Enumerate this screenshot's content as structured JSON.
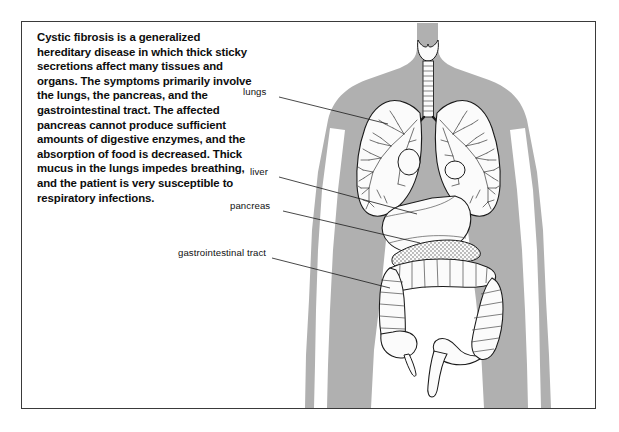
{
  "figure": {
    "description": "Cystic fibrosis is a generalized hereditary disease in which thick sticky secretions affect many tissues and organs. The symptoms primarily involve the lungs, the pancreas, and the gastrointestinal tract. The affected pancreas cannot produce sufficient amounts of digestive enzymes, and the absorption of food is decreased. Thick mucus in the lungs impedes breathing, and the patient is very susceptible to respiratory infections.",
    "colors": {
      "body_silhouette": "#b0b0b0",
      "organ_fill": "#fbfbfb",
      "outline": "#1a1a1a",
      "frame_border": "#3a3a3a",
      "background": "#ffffff",
      "text": "#0d0d0d"
    },
    "callouts": [
      {
        "id": "lungs",
        "label": "lungs",
        "label_x": 243,
        "label_y": 92,
        "line_x1": 279,
        "line_y1": 97,
        "line_x2": 388,
        "line_y2": 124
      },
      {
        "id": "liver",
        "label": "liver",
        "label_x": 250,
        "label_y": 172,
        "line_x1": 279,
        "line_y1": 177,
        "line_x2": 417,
        "line_y2": 214
      },
      {
        "id": "pancreas",
        "label": "pancreas",
        "label_x": 230,
        "label_y": 206,
        "line_x1": 283,
        "line_y1": 211,
        "line_x2": 420,
        "line_y2": 243
      },
      {
        "id": "gastrointestinal-tract",
        "label": "gastrointestinal tract",
        "label_x": 178,
        "label_y": 253,
        "line_x1": 272,
        "line_y1": 258,
        "line_x2": 390,
        "line_y2": 288
      }
    ],
    "organs": [
      "larynx",
      "trachea",
      "left lung",
      "right lung",
      "liver",
      "pancreas",
      "transverse colon",
      "ascending colon",
      "descending colon",
      "cecum",
      "appendix",
      "sigmoid colon",
      "rectum"
    ]
  }
}
